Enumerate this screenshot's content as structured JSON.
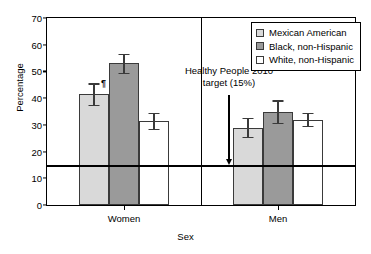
{
  "chart_data": {
    "type": "bar",
    "title": "",
    "xlabel": "Sex",
    "ylabel": "Percentage",
    "ylim": [
      0,
      70
    ],
    "yticks": [
      0,
      10,
      20,
      30,
      40,
      50,
      60,
      70
    ],
    "grid": false,
    "legend_position": "top-right",
    "categories": [
      "Women",
      "Men"
    ],
    "series": [
      {
        "name": "Mexican American",
        "color": "#d9d9d9",
        "values": [
          41.5,
          29.0
        ],
        "error_low": [
          37.5,
          25.5
        ],
        "error_high": [
          45.5,
          32.5
        ]
      },
      {
        "name": "Black, non-Hispanic",
        "color": "#9a9a9a",
        "values": [
          53.0,
          35.0
        ],
        "error_low": [
          49.5,
          30.8
        ],
        "error_high": [
          56.5,
          39.2
        ]
      },
      {
        "name": "White, non-Hispanic",
        "color": "#ffffff",
        "values": [
          31.5,
          32.0
        ],
        "error_low": [
          28.5,
          29.5
        ],
        "error_high": [
          34.5,
          34.5
        ]
      }
    ],
    "reference_line": {
      "value": 15,
      "label_line1": "Healthy People 2010",
      "label_line2": "target (15%)"
    },
    "footnote_marker": "¶"
  },
  "legend": {
    "items": [
      {
        "label": "Mexican American"
      },
      {
        "label": "Black, non-Hispanic"
      },
      {
        "label": "White, non-Hispanic"
      }
    ]
  },
  "axes": {
    "y_title": "Percentage",
    "x_title": "Sex",
    "ytick_labels": [
      "70",
      "60",
      "50",
      "40",
      "30",
      "20",
      "10",
      "0"
    ],
    "xtick_labels": [
      "Women",
      "Men"
    ]
  },
  "annotation": {
    "line1": "Healthy People 2010",
    "line2": "target (15%)"
  }
}
